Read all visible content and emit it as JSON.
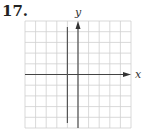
{
  "problem": {
    "number": "17."
  },
  "graph": {
    "x_label": "x",
    "y_label": "y",
    "grid": {
      "columns": 10,
      "rows": 10,
      "color": "#cfcfcf"
    },
    "axis_color": "#444444",
    "vertical_line": {
      "description": "vertical line left of y-axis, one unit left",
      "x": -1
    }
  }
}
